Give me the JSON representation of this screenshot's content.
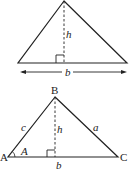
{
  "diagram1": {
    "height_label": "h",
    "base_label": "b"
  },
  "diagram2": {
    "vertex_top": "B",
    "vertex_left": "A",
    "vertex_right": "C",
    "side_left": "c",
    "side_right": "a",
    "height_label": "h",
    "base_label": "b",
    "angle_label": "A"
  },
  "colors": {
    "stroke": "#222222",
    "background": "#ffffff"
  }
}
